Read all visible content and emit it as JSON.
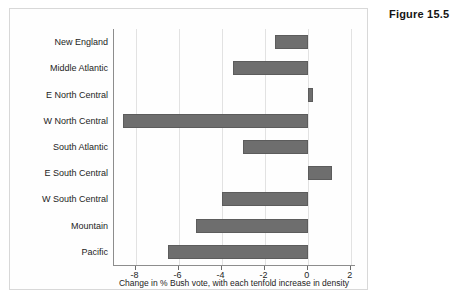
{
  "figure": {
    "caption": "Figure 15.5"
  },
  "chart_data": {
    "type": "bar",
    "orientation": "horizontal",
    "title": "",
    "xlabel": "Change in % Bush vote, with each tenfold increase in density",
    "ylabel": "",
    "categories": [
      "New England",
      "Middle Atlantic",
      "E North Central",
      "W North Central",
      "South Atlantic",
      "E South Central",
      "W South Central",
      "Mountain",
      "Pacific"
    ],
    "values": [
      -1.5,
      -3.45,
      0.25,
      -8.6,
      -3.0,
      1.15,
      -4.0,
      -5.2,
      -6.5
    ],
    "xlim": [
      -9,
      2.2
    ],
    "xticks": [
      -8,
      -6,
      -4,
      -2,
      0,
      2
    ],
    "xticklabels": [
      "-8",
      "-6",
      "-4",
      "-2",
      "0",
      "2"
    ],
    "grid": "vertical",
    "legend": "none",
    "bar_color": "#6e6e6e",
    "axis_color": "#8d8d8d",
    "gridline_color": "#e2e2e2"
  }
}
